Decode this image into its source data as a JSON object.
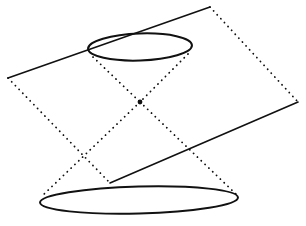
{
  "figure": {
    "background_color": "#ffffff",
    "ink_color": "#111111",
    "width": 306,
    "height": 226,
    "shapes": {
      "upper_ellipse": {
        "name": "upper-nappe-circle",
        "cx": 140,
        "cy": 47,
        "rx": 52,
        "ry": 13.5,
        "rotation": -2,
        "stroke_width": 2.0,
        "style": "solid"
      },
      "lower_ellipse": {
        "name": "lower-nappe-circle",
        "cx": 139,
        "cy": 200,
        "rx": 99,
        "ry": 13.5,
        "rotation": -1.5,
        "stroke_width": 2.0,
        "style": "solid"
      },
      "apex": {
        "name": "cone-apex",
        "x": 140,
        "y": 102,
        "radius": 2.4
      },
      "cutting_plane": {
        "name": "cutting-plane-parallelogram",
        "corners": [
          {
            "label": "left",
            "x": 8,
            "y": 78
          },
          {
            "label": "top",
            "x": 210,
            "y": 7
          },
          {
            "label": "right",
            "x": 298,
            "y": 102
          },
          {
            "label": "bottom",
            "x": 110,
            "y": 183
          }
        ],
        "solid_edges": [
          {
            "from": "left",
            "to": "top"
          },
          {
            "from": "bottom",
            "to": "right"
          }
        ],
        "dotted_edges": [
          {
            "from": "top",
            "to": "right"
          },
          {
            "from": "left",
            "to": "bottom"
          }
        ],
        "stroke_width_solid": 1.6,
        "stroke_width_dotted": 1.8,
        "dash_pattern": "0.1 5.2"
      },
      "cone_generators": [
        {
          "name": "generator-upper-left",
          "x1": 93,
          "y1": 57,
          "x2": 140,
          "y2": 102,
          "style": "dotted"
        },
        {
          "name": "generator-upper-right",
          "x1": 188,
          "y1": 54,
          "x2": 140,
          "y2": 102,
          "style": "dotted"
        },
        {
          "name": "generator-lower-left",
          "x1": 140,
          "y1": 102,
          "x2": 41,
          "y2": 197,
          "style": "dotted"
        },
        {
          "name": "generator-lower-right",
          "x1": 140,
          "y1": 102,
          "x2": 237,
          "y2": 195,
          "style": "dotted"
        }
      ]
    }
  }
}
